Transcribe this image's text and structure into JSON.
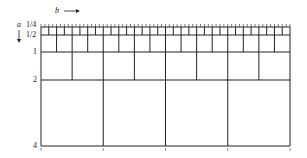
{
  "diagram": {
    "axis_a_label": "a",
    "axis_b_label": "b",
    "row_labels": [
      "1/4",
      "1/2",
      "1",
      "2",
      "4"
    ],
    "grid": {
      "left": 41,
      "right": 290,
      "rows_y": [
        27,
        35,
        52,
        80,
        146
      ],
      "columns_per_row": [
        32,
        16,
        8,
        4
      ]
    },
    "line_color": "#222222",
    "background": "#ffffff"
  }
}
